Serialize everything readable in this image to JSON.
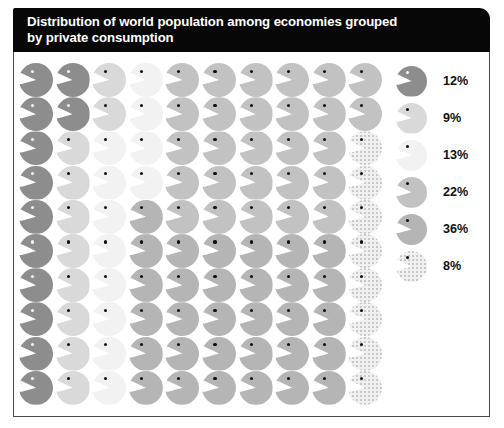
{
  "header": {
    "title": "Distribution of world population among economies grouped\nby private consumption"
  },
  "legend": {
    "items": [
      {
        "label": "12%",
        "category_index": 0,
        "color": "#8d8d8d",
        "dot": "light"
      },
      {
        "label": "9%",
        "category_index": 1,
        "color": "#d9d9d9",
        "dot": "dark"
      },
      {
        "label": "13%",
        "category_index": 2,
        "color": "#f2f2f2",
        "dot": "dark"
      },
      {
        "label": "22%",
        "category_index": 3,
        "color": "#c2c2c2",
        "dot": "dark"
      },
      {
        "label": "36%",
        "category_index": 4,
        "color": "#b5b5b5",
        "dot": "dark"
      },
      {
        "label": "8%",
        "category_index": 5,
        "color": "#f0f0f0",
        "dot": "dark"
      }
    ]
  },
  "chart_data": {
    "type": "pie",
    "title": "Distribution of world population among economies grouped by private consumption",
    "xlabel": "",
    "ylabel": "",
    "unit": "percent of world population",
    "glyph": "circle-with-notch",
    "glyph_total": 100,
    "grid_rows": 10,
    "grid_columns": 10,
    "fill_order": "column-major",
    "categories": [
      "12%",
      "9%",
      "13%",
      "22%",
      "36%",
      "8%"
    ],
    "values": [
      12,
      9,
      13,
      22,
      36,
      8
    ],
    "colors": [
      "#8d8d8d",
      "#d9d9d9",
      "#f2f2f2",
      "#c2c2c2",
      "#b5b5b5",
      "#f0f0f0"
    ],
    "legend_position": "right",
    "grid": false,
    "cells": [
      0,
      0,
      1,
      2,
      3,
      3,
      3,
      3,
      3,
      3,
      0,
      0,
      1,
      2,
      3,
      3,
      3,
      3,
      3,
      3,
      0,
      1,
      2,
      2,
      3,
      3,
      3,
      3,
      3,
      5,
      0,
      1,
      2,
      2,
      3,
      3,
      3,
      3,
      3,
      5,
      0,
      1,
      2,
      4,
      3,
      3,
      3,
      3,
      3,
      5,
      0,
      1,
      2,
      4,
      4,
      4,
      4,
      4,
      4,
      5,
      0,
      1,
      2,
      4,
      4,
      4,
      4,
      4,
      4,
      5,
      0,
      1,
      2,
      4,
      4,
      4,
      4,
      4,
      4,
      5,
      0,
      1,
      2,
      4,
      4,
      4,
      4,
      4,
      4,
      5,
      0,
      1,
      2,
      4,
      4,
      4,
      4,
      4,
      4,
      5
    ]
  }
}
